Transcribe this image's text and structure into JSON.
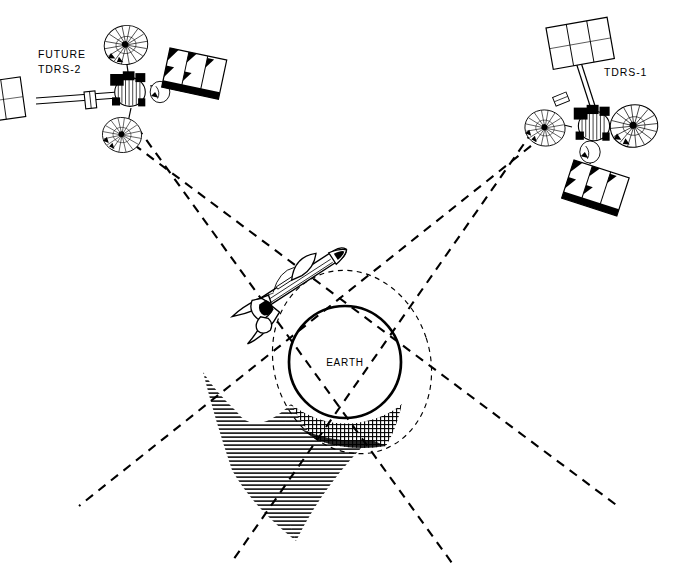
{
  "diagram": {
    "background_color": "#ffffff",
    "ink_color": "#000000",
    "width": 681,
    "height": 570
  },
  "labels": {
    "tdrs2_line1": "FUTURE",
    "tdrs2_line2": "TDRS-2",
    "tdrs1": "TDRS-1",
    "earth": "EARTH"
  },
  "bodies": {
    "earth": {
      "name": "EARTH",
      "center_x": 345,
      "center_y": 362,
      "radius": 56,
      "outline_width": 2.6
    },
    "orbit": {
      "name": "shuttle-orbit",
      "center_x": 352,
      "center_y": 362,
      "rx": 78,
      "ry": 92,
      "rotation_deg": -18,
      "dash": "5,4",
      "stroke_width": 1.1
    },
    "shuttle": {
      "name": "space-shuttle-orbiter",
      "x": 292,
      "y": 288,
      "rotation_deg": -34
    }
  },
  "satellites": [
    {
      "id": "tdrs-2",
      "label_line1": "FUTURE",
      "label_line2": "TDRS-2",
      "label_x": 38,
      "label_y": 58,
      "center_x": 133,
      "center_y": 92,
      "rotation_deg": 0
    },
    {
      "id": "tdrs-1",
      "label_line1": "TDRS-1",
      "label_line2": "",
      "label_x": 604,
      "label_y": 76,
      "center_x": 596,
      "center_y": 128,
      "rotation_deg": 0
    }
  ],
  "beams": [
    {
      "id": "tdrs2-beam-upper",
      "x1": 121,
      "y1": 133,
      "x2": 618,
      "y2": 507,
      "dash": "9,7"
    },
    {
      "id": "tdrs2-beam-lower",
      "x1": 136,
      "y1": 125,
      "x2": 455,
      "y2": 560,
      "dash": "9,7"
    },
    {
      "id": "tdrs1-beam-upper",
      "x1": 556,
      "y1": 124,
      "x2": 80,
      "y2": 506,
      "dash": "9,7"
    },
    {
      "id": "tdrs1-beam-lower",
      "x1": 541,
      "y1": 117,
      "x2": 232,
      "y2": 560,
      "dash": "9,7"
    }
  ],
  "shadow_zone": {
    "id": "zone-of-exclusion",
    "hatch_style": "horizontal-lines",
    "hatch_spacing_px": 4,
    "crosshatch_style": "grid",
    "apex_x": 295,
    "apex_y": 541
  },
  "colors": {
    "ink": "#000000",
    "paper": "#ffffff"
  }
}
